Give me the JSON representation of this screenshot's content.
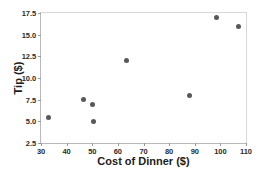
{
  "chart_data": {
    "type": "scatter",
    "title": "",
    "xlabel": "Cost of Dinner  ($)",
    "ylabel": "Tip ($)",
    "xlim": [
      30,
      110
    ],
    "ylim": [
      2.5,
      17.5
    ],
    "xticks": [
      30,
      40,
      50,
      60,
      70,
      80,
      90,
      100,
      110
    ],
    "yticks": [
      "2.5",
      "5.0",
      "7.5",
      "10.0",
      "12.5",
      "15.0",
      "17.5"
    ],
    "grid": false,
    "legend": null,
    "marker_color": "#58585c",
    "axis_color": "#b9b9bd",
    "points": [
      {
        "x": 33.0,
        "y": 5.4
      },
      {
        "x": 46.5,
        "y": 7.5
      },
      {
        "x": 50.0,
        "y": 7.0
      },
      {
        "x": 50.5,
        "y": 5.0
      },
      {
        "x": 63.5,
        "y": 12.0
      },
      {
        "x": 88.0,
        "y": 8.0
      },
      {
        "x": 98.5,
        "y": 17.0
      },
      {
        "x": 107.0,
        "y": 16.0
      }
    ]
  }
}
